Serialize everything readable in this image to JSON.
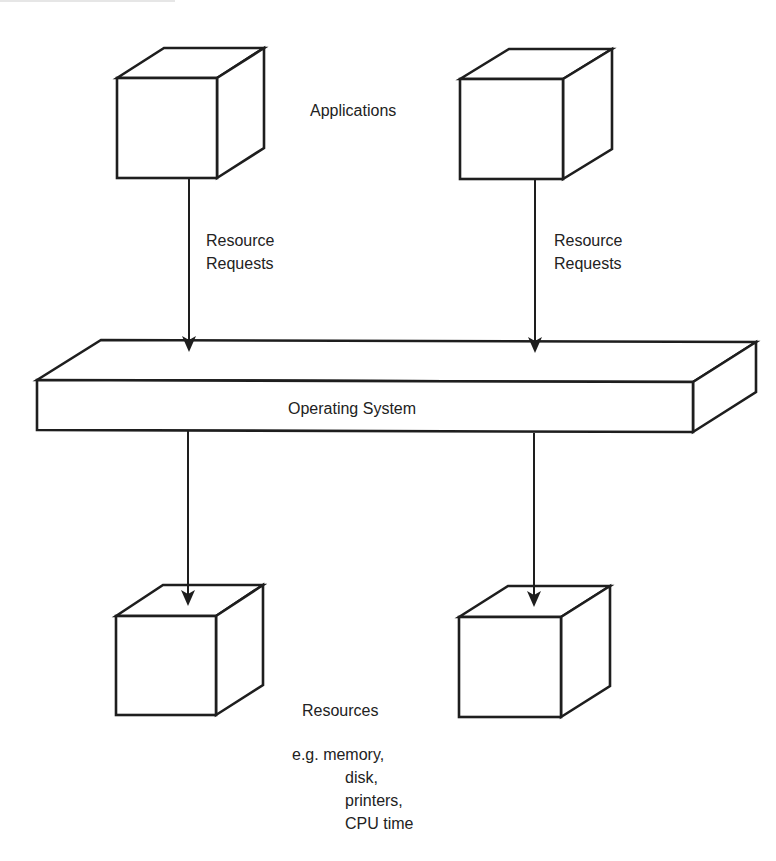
{
  "diagram": {
    "type": "resource-management-architecture",
    "layers": {
      "applications": {
        "label": "Applications",
        "nodes": [
          {
            "id": "app-1",
            "shape": "cube"
          },
          {
            "id": "app-2",
            "shape": "cube"
          }
        ]
      },
      "operating_system": {
        "label": "Operating System",
        "shape": "slab"
      },
      "resources": {
        "label": "Resources",
        "examples_intro": "e.g. memory,",
        "examples": [
          "disk,",
          "printers,",
          "CPU time"
        ],
        "nodes": [
          {
            "id": "res-1",
            "shape": "cube"
          },
          {
            "id": "res-2",
            "shape": "cube"
          }
        ]
      }
    },
    "edges": [
      {
        "from": "app-1",
        "to": "operating_system",
        "label_line1": "Resource",
        "label_line2": "Requests"
      },
      {
        "from": "app-2",
        "to": "operating_system",
        "label_line1": "Resource",
        "label_line2": "Requests"
      },
      {
        "from": "operating_system",
        "to": "res-1",
        "label_line1": "",
        "label_line2": ""
      },
      {
        "from": "operating_system",
        "to": "res-2",
        "label_line1": "",
        "label_line2": ""
      }
    ],
    "colors": {
      "stroke": "#1e1e1e",
      "text": "#222222",
      "background": "#ffffff"
    }
  }
}
